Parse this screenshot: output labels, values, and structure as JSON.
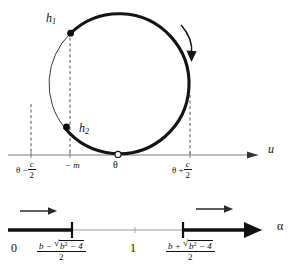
{
  "figure": {
    "colors": {
      "ink": "#111111",
      "thin_line": "#8a8a8a",
      "dashed": "#444444",
      "background": "#ffffff"
    },
    "circle_panel": {
      "points": [
        {
          "id": "h1",
          "label": "h",
          "subscript": "1",
          "marker": "filled-dot"
        },
        {
          "id": "h2",
          "label": "h",
          "subscript": "2",
          "marker": "filled-dot"
        },
        {
          "id": "theta_tangent",
          "label": "",
          "subscript": "",
          "marker": "open-dot"
        }
      ],
      "axis_label": "u",
      "rotation_direction": "clockwise",
      "ticks": [
        {
          "id": "theta-minus-c-over-2",
          "type": "fraction-expression",
          "lead": "θ −",
          "numerator": "c",
          "denominator": "2"
        },
        {
          "id": "minus-m",
          "type": "plain",
          "text": "− m"
        },
        {
          "id": "theta",
          "type": "plain",
          "text": "θ"
        },
        {
          "id": "theta-plus-c-over-2",
          "type": "fraction-expression",
          "lead": "θ +",
          "numerator": "c",
          "denominator": "2"
        }
      ]
    },
    "alpha_panel": {
      "axis_label": "α",
      "ticks": [
        {
          "id": "zero",
          "text": "0"
        },
        {
          "id": "one",
          "text": "1"
        }
      ],
      "roots": [
        {
          "id": "root-minus",
          "numerator_lead": "b −",
          "radicand_base": "b",
          "radicand_exponent": "2",
          "radicand_tail": "− 4",
          "denominator": "2"
        },
        {
          "id": "root-plus",
          "numerator_lead": "b +",
          "radicand_base": "b",
          "radicand_exponent": "2",
          "radicand_tail": "− 4",
          "denominator": "2"
        }
      ],
      "flow_arrows": [
        {
          "id": "flow-left",
          "direction": "right"
        },
        {
          "id": "flow-right",
          "direction": "right"
        }
      ],
      "bold_intervals": [
        {
          "id": "interval-0-to-root-minus"
        },
        {
          "id": "interval-root-plus-to-infinity"
        }
      ]
    }
  }
}
